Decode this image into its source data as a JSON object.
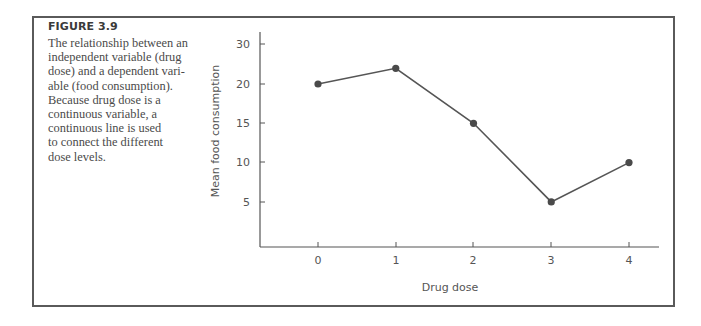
{
  "figure": {
    "label": "FIGURE 3.9",
    "caption_lines": [
      "The relationship between an",
      "independent variable (drug",
      "dose) and a dependent vari-",
      "able (food consumption).",
      "Because drug dose is a",
      "continuous variable, a",
      "continuous line is used",
      "to connect the different",
      "dose levels."
    ]
  },
  "chart_data": {
    "type": "line",
    "title": "",
    "xlabel": "Drug dose",
    "ylabel": "Mean food consumption",
    "x": [
      0,
      1,
      2,
      3,
      4
    ],
    "categories": [
      "0",
      "1",
      "2",
      "3",
      "4"
    ],
    "series": [
      {
        "name": "Mean food consumption",
        "values": [
          20,
          22,
          15,
          5,
          10
        ]
      }
    ],
    "y_tick_labels": [
      "5",
      "10",
      "15",
      "20",
      "30"
    ],
    "ylim": [
      0,
      30
    ],
    "grid": false,
    "legend": "none",
    "line_color": "#555555",
    "marker": "filled-circle"
  }
}
